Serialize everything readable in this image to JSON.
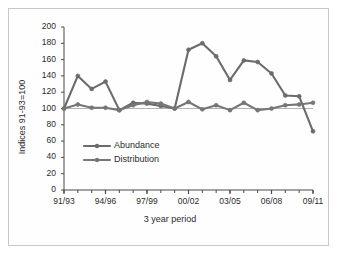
{
  "chart_data": {
    "type": "line",
    "title": "",
    "xlabel": "3 year period",
    "ylabel": "Indices 91-93=100",
    "ylim": [
      0,
      200
    ],
    "ytick_labels": [
      "200",
      "180",
      "160",
      "140",
      "120",
      "100",
      "80",
      "60",
      "40",
      "20",
      "0"
    ],
    "ytick_values": [
      200,
      180,
      160,
      140,
      120,
      100,
      80,
      60,
      40,
      20,
      0
    ],
    "grid": false,
    "legend_position": "inside-lower-left",
    "x": [
      "91/93",
      "92/94",
      "93/95",
      "94/96",
      "95/97",
      "96/98",
      "97/99",
      "98/00",
      "99/01",
      "00/02",
      "01/03",
      "02/04",
      "03/05",
      "04/06",
      "05/07",
      "06/08",
      "07/09",
      "08/10",
      "09/11"
    ],
    "xtick_labels": [
      "91/93",
      "94/96",
      "97/99",
      "00/02",
      "03/05",
      "06/08",
      "09/11"
    ],
    "xtick_indices": [
      0,
      3,
      6,
      9,
      12,
      15,
      18
    ],
    "series": [
      {
        "name": "Abundance",
        "color": "#6b6b6b",
        "values": [
          100,
          140,
          124,
          133,
          98,
          107,
          106,
          103,
          100,
          172,
          180,
          164,
          135,
          159,
          157,
          143,
          116,
          115,
          72
        ]
      },
      {
        "name": "Distribution",
        "color": "#767676",
        "values": [
          100,
          105,
          101,
          101,
          98,
          104,
          108,
          106,
          100,
          108,
          99,
          104,
          98,
          107,
          98,
          100,
          104,
          105,
          107
        ]
      }
    ]
  },
  "legend": {
    "items": [
      {
        "label": "Abundance"
      },
      {
        "label": "Distribution"
      }
    ]
  },
  "colors": {
    "line": "#6b6b6b",
    "axis": "#4a4a4a",
    "text": "#2b2b2b",
    "frame": "#c8c8c8",
    "baseline": "#8f8f8f"
  }
}
